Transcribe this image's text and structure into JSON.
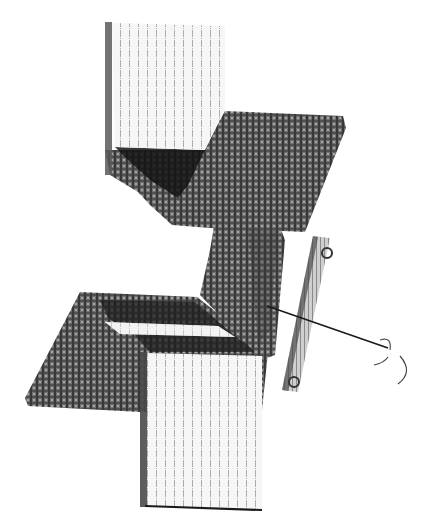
{
  "figure": {
    "canvas": {
      "width": 424,
      "height": 523,
      "background": "#ffffff"
    },
    "colors": {
      "light_panel": "#f3f3f3",
      "light_hatch": "#9a9a9a",
      "dark_panel": "#6e6e6e",
      "dark_hatch": "#2e2e2e",
      "shadow": "#1c1c1c",
      "edge": "#222222",
      "rod": "#8a8a8a",
      "wire": "#1a1a1a"
    },
    "elements": [
      {
        "id": "top-light-panel",
        "label": ""
      },
      {
        "id": "upper-dark-plane",
        "label": ""
      },
      {
        "id": "middle-dark-column",
        "label": ""
      },
      {
        "id": "lower-dark-plane",
        "label": ""
      },
      {
        "id": "bottom-light-panel",
        "label": ""
      },
      {
        "id": "pin-rod",
        "label": ""
      },
      {
        "id": "wire-hook",
        "label": ""
      }
    ]
  }
}
